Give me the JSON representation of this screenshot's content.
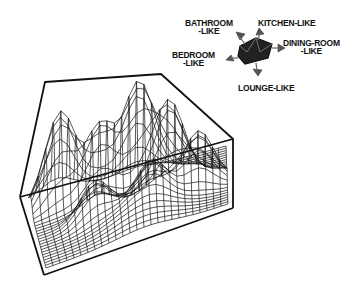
{
  "figure": {
    "type": "3d-wireframe-surface",
    "colors": {
      "ink": "#111111",
      "background": "#ffffff"
    }
  },
  "key": {
    "icon": "room-direction-key-icon",
    "labels": {
      "bathroom": [
        "BATHROOM",
        "-LIKE"
      ],
      "kitchen": [
        "KITCHEN-LIKE"
      ],
      "dining": [
        "DINING-ROOM",
        "-LIKE"
      ],
      "bedroom": [
        "BEDROOM",
        "-LIKE"
      ],
      "lounge": [
        "LOUNGE-LIKE"
      ]
    }
  }
}
